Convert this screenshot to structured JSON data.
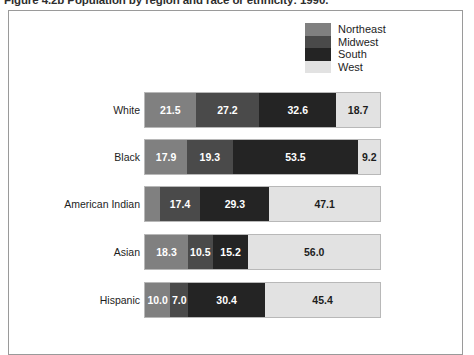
{
  "caption": "Figure 4.2b  Population by region and race or ethnicity: 1990.",
  "legend": {
    "position": "top-right",
    "items": [
      {
        "label": "Northeast",
        "color": "#808080"
      },
      {
        "label": "Midwest",
        "color": "#4a4a4a"
      },
      {
        "label": "South",
        "color": "#242424"
      },
      {
        "label": "West",
        "color": "#e2e2e2"
      }
    ]
  },
  "chart_data": {
    "type": "bar",
    "orientation": "horizontal",
    "stacked": true,
    "normalized": true,
    "title": "Figure 4.2b  Population by region and race or ethnicity: 1990.",
    "xlabel": "",
    "ylabel": "",
    "xlim": [
      0,
      100
    ],
    "grid": false,
    "legend_position": "top-right",
    "categories": [
      "White",
      "Black",
      "American Indian",
      "Asian",
      "Hispanic"
    ],
    "series": [
      {
        "name": "Northeast",
        "color": "#808080",
        "values": [
          21.5,
          17.9,
          6.2,
          18.3,
          10.0
        ]
      },
      {
        "name": "Midwest",
        "color": "#4a4a4a",
        "values": [
          27.2,
          19.3,
          17.4,
          10.5,
          7.0
        ]
      },
      {
        "name": "South",
        "color": "#242424",
        "values": [
          32.6,
          53.5,
          29.3,
          15.2,
          30.4
        ]
      },
      {
        "name": "West",
        "color": "#e2e2e2",
        "values": [
          18.7,
          9.2,
          47.1,
          56.0,
          45.4
        ]
      }
    ],
    "data_labels": [
      {
        "category": "White",
        "labels": [
          "21.5",
          "27.2",
          "32.6",
          "18.7"
        ]
      },
      {
        "category": "Black",
        "labels": [
          "17.9",
          "19.3",
          "53.5",
          "9.2"
        ]
      },
      {
        "category": "American Indian",
        "labels": [
          "",
          "17.4",
          "29.3",
          "47.1"
        ]
      },
      {
        "category": "Asian",
        "labels": [
          "18.3",
          "10.5",
          "15.2",
          "56.0"
        ]
      },
      {
        "category": "Hispanic",
        "labels": [
          "10.0",
          "7.0",
          "30.4",
          "45.4"
        ]
      }
    ]
  }
}
